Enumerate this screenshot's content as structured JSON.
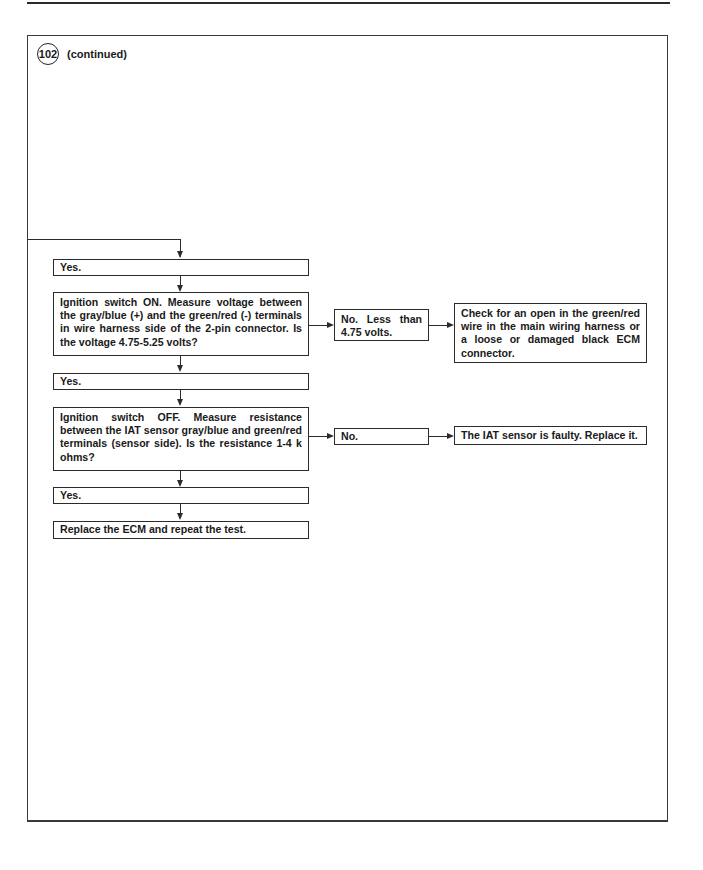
{
  "page": {
    "step_number": "102",
    "step_suffix": "(continued)"
  },
  "flowchart": {
    "yes_1": "Yes.",
    "question_1": "Ignition switch ON. Measure voltage between the gray/blue (+) and the green/red (-) terminals in wire harness side of the 2-pin connector.  Is the voltage 4.75-5.25 volts?",
    "no_1": "No.   Less   than 4.75 volts.",
    "result_no_1": "Check for an open in the green/red wire in the main wiring harness or a loose or damaged black ECM connector.",
    "yes_2": "Yes.",
    "question_2": "Ignition switch OFF. Measure resistance between the IAT sensor gray/blue and green/red terminals (sensor side). Is the resistance 1-4 k ohms?",
    "no_2": "No.",
    "result_no_2": "The IAT sensor is faulty. Replace it.",
    "yes_3": "Yes.",
    "final_action": "Replace the ECM and repeat the test."
  }
}
